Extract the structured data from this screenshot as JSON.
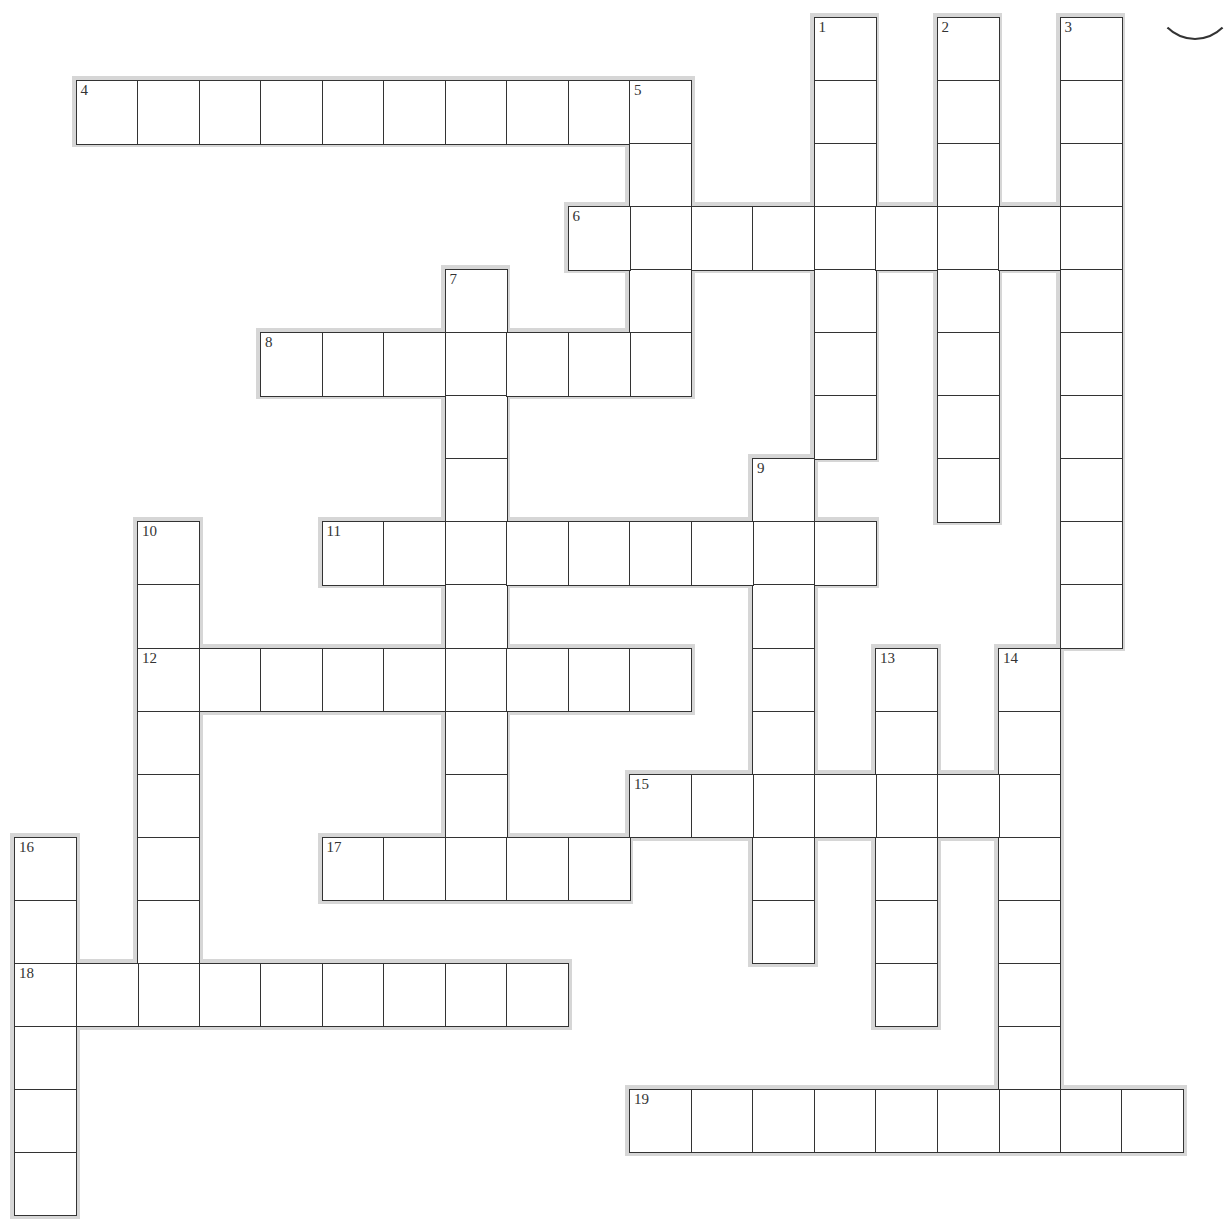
{
  "puzzle": {
    "type": "crossword",
    "grid": {
      "origin_x": 14,
      "origin_y": 17,
      "cell_w": 61.5,
      "cell_h": 63.05
    },
    "colors": {
      "line": "#333333",
      "shadow": "#d6d6d6",
      "background": "#ffffff"
    },
    "words": [
      {
        "number": "1",
        "direction": "down",
        "row": 0,
        "col": 13,
        "length": 7
      },
      {
        "number": "2",
        "direction": "down",
        "row": 0,
        "col": 15,
        "length": 8
      },
      {
        "number": "3",
        "direction": "down",
        "row": 0,
        "col": 17,
        "length": 10
      },
      {
        "number": "4",
        "direction": "across",
        "row": 1,
        "col": 1,
        "length": 10
      },
      {
        "number": "5",
        "direction": "down",
        "row": 1,
        "col": 10,
        "length": 5
      },
      {
        "number": "6",
        "direction": "across",
        "row": 3,
        "col": 9,
        "length": 9
      },
      {
        "number": "7",
        "direction": "down",
        "row": 4,
        "col": 7,
        "length": 10
      },
      {
        "number": "8",
        "direction": "across",
        "row": 5,
        "col": 4,
        "length": 7
      },
      {
        "number": "9",
        "direction": "down",
        "row": 7,
        "col": 12,
        "length": 8
      },
      {
        "number": "10",
        "direction": "down",
        "row": 8,
        "col": 2,
        "length": 8
      },
      {
        "number": "11",
        "direction": "across",
        "row": 8,
        "col": 5,
        "length": 9
      },
      {
        "number": "12",
        "direction": "across",
        "row": 10,
        "col": 2,
        "length": 9
      },
      {
        "number": "13",
        "direction": "down",
        "row": 10,
        "col": 14,
        "length": 6
      },
      {
        "number": "14",
        "direction": "down",
        "row": 10,
        "col": 16,
        "length": 8
      },
      {
        "number": "15",
        "direction": "across",
        "row": 12,
        "col": 10,
        "length": 7
      },
      {
        "number": "16",
        "direction": "down",
        "row": 13,
        "col": 0,
        "length": 6
      },
      {
        "number": "17",
        "direction": "across",
        "row": 13,
        "col": 5,
        "length": 5
      },
      {
        "number": "18",
        "direction": "across",
        "row": 15,
        "col": 0,
        "length": 9
      },
      {
        "number": "19",
        "direction": "across",
        "row": 17,
        "col": 10,
        "length": 9
      }
    ]
  }
}
